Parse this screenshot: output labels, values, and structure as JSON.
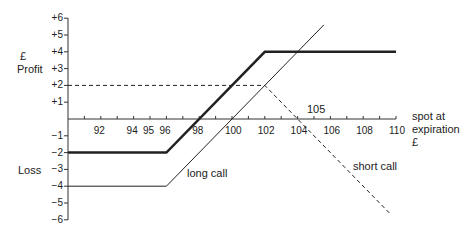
{
  "chart_data": {
    "type": "line",
    "title": "",
    "xlabel": "spot at expiration £",
    "ylabel": "£ Profit / Loss",
    "ylabel_top": [
      "£",
      "Profit"
    ],
    "ylabel_bottom": "Loss",
    "xlabel_lines": [
      "spot at",
      "expiration",
      "£"
    ],
    "xlim": [
      90,
      110
    ],
    "ylim": [
      -6,
      6
    ],
    "x_ticks": [
      92,
      94,
      95,
      96,
      98,
      100,
      102,
      104,
      106,
      108,
      110
    ],
    "y_ticks": [
      "+6",
      "+5",
      "+4",
      "+3",
      "+2",
      "+1",
      "-1",
      "-2",
      "-3",
      "-4",
      "-5",
      "-6"
    ],
    "annotations": [
      {
        "text": "105",
        "x": 105,
        "y": 0.5
      },
      {
        "text": "long call",
        "x": 101,
        "y": -3.5
      },
      {
        "text": "short call",
        "x": 107,
        "y": -2
      }
    ],
    "grid": false,
    "series": [
      {
        "name": "long call",
        "style": "thin solid",
        "x": [
          90,
          96,
          105.6
        ],
        "y": [
          -4,
          -4,
          5.6
        ]
      },
      {
        "name": "short call",
        "style": "dashed",
        "x": [
          90,
          102,
          109.6
        ],
        "y": [
          2,
          2,
          -5.6
        ]
      },
      {
        "name": "combined (bull spread)",
        "style": "bold solid",
        "x": [
          90,
          96,
          102,
          110
        ],
        "y": [
          -2,
          -2,
          4,
          4
        ]
      }
    ]
  }
}
